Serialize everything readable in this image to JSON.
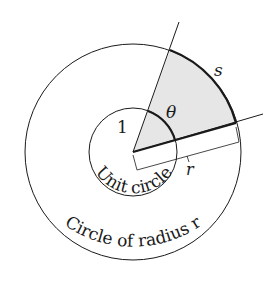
{
  "diagram": {
    "labels": {
      "one": "1",
      "theta": "θ",
      "s": "s",
      "r": "r",
      "unit_circle": "Unit circle",
      "outer_circle": "Circle of radius r"
    },
    "colors": {
      "line": "#1a1a1a",
      "sector_fill": "#e6e6e6",
      "background": "#ffffff"
    }
  }
}
